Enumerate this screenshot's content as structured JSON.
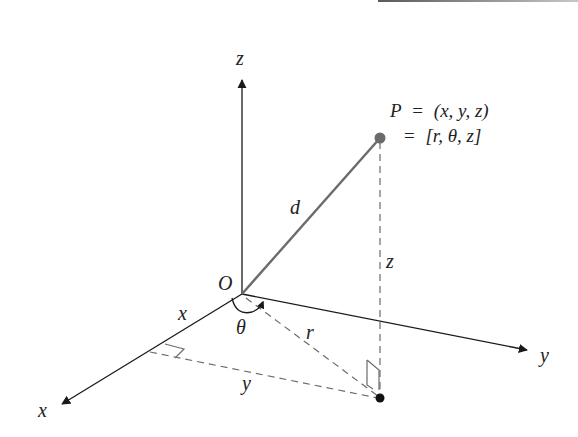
{
  "figure": {
    "type": "3D cylindrical coordinate diagram",
    "colors": {
      "axis": "#1a1a1a",
      "segment_d": "#6b6b6b",
      "dashed": "#6b6b6b",
      "point_P": "#6b6b6b",
      "point_projection": "#111111",
      "text": "#222222",
      "top_rule": "#8a8a8a"
    },
    "axes": {
      "z": {
        "label": "z"
      },
      "x": {
        "label": "x"
      },
      "y": {
        "label": "y"
      }
    },
    "origin": {
      "label": "O"
    },
    "point": {
      "name": "P",
      "line1_lhs": "P",
      "line1_eq": "=",
      "line1_rhs": "(x, y, z)",
      "line2_eq": "=",
      "line2_rhs": "[r, θ, z]"
    },
    "labels": {
      "d": "d",
      "z_height": "z",
      "r": "r",
      "theta": "θ",
      "x_component": "x",
      "y_component": "y"
    }
  }
}
